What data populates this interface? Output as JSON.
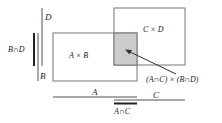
{
  "diagram": {
    "title": "",
    "labels": {
      "D": "D",
      "B": "B",
      "B_cap_D": "B∩D",
      "A_times_B": "A × B",
      "C_times_D": "C × D",
      "intersection_product": "(A∩C) × (B∩D)",
      "A": "A",
      "C": "C",
      "A_cap_C": "A∩C"
    },
    "colors": {
      "stroke": "#555555",
      "intersection_fill": "#cccccc",
      "thick_line": "#222222"
    }
  }
}
